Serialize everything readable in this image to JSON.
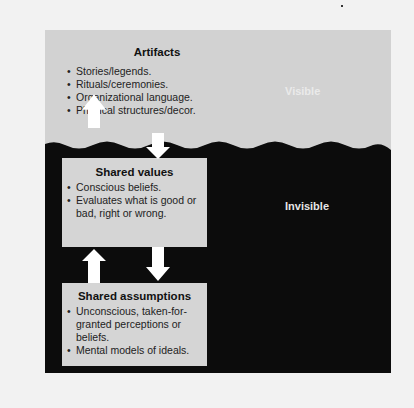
{
  "diagram": {
    "title": "",
    "colors": {
      "above_water": "#d2d2d2",
      "below_water": "#0c0c0c",
      "box": "#d5d5d5",
      "arrow": "#ffffff"
    },
    "levels": [
      {
        "id": "artifacts",
        "title": "Artifacts",
        "zone": "visible",
        "items": [
          "Stories/legends.",
          "Rituals/ceremonies.",
          "Organizational language.",
          "Physical structures/decor."
        ]
      },
      {
        "id": "shared_values",
        "title": "Shared values",
        "zone": "invisible",
        "items": [
          "Conscious beliefs.",
          "Evaluates what is good or bad, right or wrong."
        ]
      },
      {
        "id": "shared_assumptions",
        "title": "Shared assumptions",
        "zone": "invisible",
        "items": [
          "Unconscious, taken-for-granted perceptions or beliefs.",
          "Mental models of ideals."
        ]
      }
    ],
    "zone_labels": {
      "visible": "Visible",
      "invisible": "Invisible"
    },
    "connections": [
      {
        "from": "shared_values",
        "to": "artifacts",
        "direction": "up"
      },
      {
        "from": "artifacts",
        "to": "shared_values",
        "direction": "down"
      },
      {
        "from": "shared_assumptions",
        "to": "shared_values",
        "direction": "up"
      },
      {
        "from": "shared_values",
        "to": "shared_assumptions",
        "direction": "down"
      }
    ]
  }
}
